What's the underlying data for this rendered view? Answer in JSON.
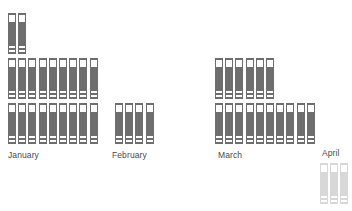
{
  "chart_data": {
    "type": "pictogram",
    "title": "",
    "subtitle": "",
    "xlabel": "",
    "ylabel": "",
    "unit_icon": "document-bar-icon",
    "unit_value": 1,
    "legend": [],
    "grid": false,
    "colors": {
      "icon_primary": "#6e6e6e",
      "icon_faded": "#d8d8d8",
      "label_text": "#4a4a4a",
      "background": "#ffffff"
    },
    "categories": [
      "January",
      "February",
      "March",
      "April"
    ],
    "values": [
      20,
      4,
      16,
      3
    ],
    "series": [
      {
        "name": "count",
        "values": [
          20,
          4,
          16,
          3
        ]
      }
    ],
    "groups": [
      {
        "label": "January",
        "count": 20,
        "state": "normal",
        "rows": [
          2,
          9,
          9
        ],
        "x": 8,
        "y": 13,
        "label_x": 8,
        "label_y": 150
      },
      {
        "label": "February",
        "count": 4,
        "state": "normal",
        "rows": [
          4
        ],
        "x": 115,
        "y": 103,
        "label_x": 112,
        "label_y": 150
      },
      {
        "label": "March",
        "count": 16,
        "state": "normal",
        "rows": [
          6,
          10
        ],
        "x": 215,
        "y": 58,
        "label_x": 218,
        "label_y": 150
      },
      {
        "label": "April",
        "count": 3,
        "state": "faded",
        "rows": [
          3
        ],
        "x": 320,
        "y": 163,
        "label_x": 322,
        "label_y": 148
      }
    ]
  }
}
